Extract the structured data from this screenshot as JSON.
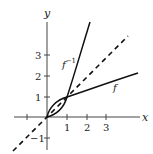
{
  "diagram": {
    "title": "",
    "axes": {
      "x_label": "x",
      "y_label": "y",
      "x_ticks": [
        {
          "value": -1,
          "label": ""
        },
        {
          "value": 1,
          "label": "1"
        },
        {
          "value": 2,
          "label": "2"
        },
        {
          "value": 3,
          "label": "3"
        }
      ],
      "y_ticks": [
        {
          "value": -1,
          "label": "−1"
        },
        {
          "value": 1,
          "label": "1"
        },
        {
          "value": 2,
          "label": "2"
        },
        {
          "value": 3,
          "label": "3"
        }
      ]
    },
    "curves": {
      "f": {
        "label": "f",
        "description": "increasing concave curve through (0,0) and (1,1)"
      },
      "f_inverse": {
        "label": "f",
        "superscript": "−1",
        "description": "reflection of f across y = x, increasing convex through (0,0) and (1,1)"
      },
      "identity": {
        "label": "",
        "description": "dashed line y = x"
      }
    },
    "colors": {
      "curve": "#111111",
      "axis": "#444444",
      "background": "#ffffff"
    }
  }
}
